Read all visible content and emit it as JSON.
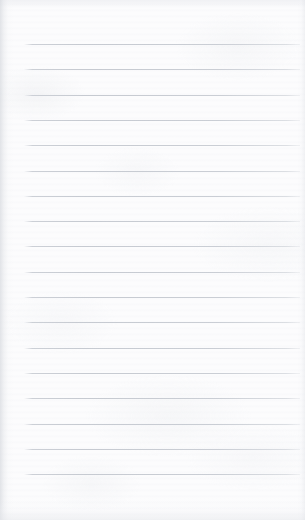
{
  "document": {
    "kind": "ruled-notebook-page",
    "title": "Ruled paper sheet",
    "content_text": "",
    "is_blank": true,
    "page_width_px": 305,
    "page_height_px": 520
  },
  "paper": {
    "background_color": "#fcfcfd",
    "texture": "mottled-fibre",
    "edge_shadow_color": "#d6d9de"
  },
  "ruling": {
    "line_color": "#c6cad1",
    "line_thickness_px": 1,
    "line_count": 18,
    "line_spacing_px": 25.2,
    "first_line_y_px": 44,
    "last_line_y_px": 491,
    "line_start_x_px": 24,
    "line_end_x_px": 300,
    "top_margin_px": 44,
    "left_margin_px": 24,
    "has_vertical_margin_rule": false,
    "line_y_positions": [
      44,
      69.3,
      94.6,
      119.9,
      145.2,
      170.5,
      195.8,
      221.1,
      246.4,
      271.7,
      297.0,
      322.3,
      347.6,
      372.9,
      398.2,
      423.5,
      448.8,
      474.1
    ],
    "lines": [
      {
        "index": 1,
        "text": ""
      },
      {
        "index": 2,
        "text": ""
      },
      {
        "index": 3,
        "text": ""
      },
      {
        "index": 4,
        "text": ""
      },
      {
        "index": 5,
        "text": ""
      },
      {
        "index": 6,
        "text": ""
      },
      {
        "index": 7,
        "text": ""
      },
      {
        "index": 8,
        "text": ""
      },
      {
        "index": 9,
        "text": ""
      },
      {
        "index": 10,
        "text": ""
      },
      {
        "index": 11,
        "text": ""
      },
      {
        "index": 12,
        "text": ""
      },
      {
        "index": 13,
        "text": ""
      },
      {
        "index": 14,
        "text": ""
      },
      {
        "index": 15,
        "text": ""
      },
      {
        "index": 16,
        "text": ""
      },
      {
        "index": 17,
        "text": ""
      },
      {
        "index": 18,
        "text": ""
      }
    ]
  }
}
